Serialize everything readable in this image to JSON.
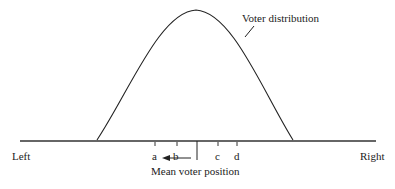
{
  "diagram": {
    "curve_label": "Voter distribution",
    "axis": {
      "left_label": "Left",
      "right_label": "Right"
    },
    "positions": [
      {
        "label": "a"
      },
      {
        "label": "b"
      },
      {
        "label": "c"
      },
      {
        "label": "d"
      }
    ],
    "mean_label": "Mean voter position",
    "arrow_direction": "left",
    "colors": {
      "line": "#222222",
      "background": "#ffffff"
    }
  }
}
